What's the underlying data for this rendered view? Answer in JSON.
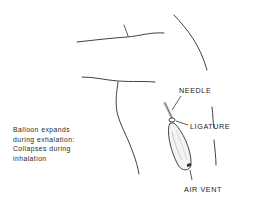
{
  "diagram": {
    "labels": {
      "needle": "NEEDLE",
      "ligature": "LIGATURE",
      "air_vent": "AIR VENT"
    },
    "caption": {
      "lines": [
        "Balloon expands",
        "during exhalation:",
        "Collapses during",
        "inhalation"
      ]
    },
    "colors": {
      "line": "#2b2b2b",
      "text": "#1a1a1a",
      "background": "#ffffff"
    }
  }
}
